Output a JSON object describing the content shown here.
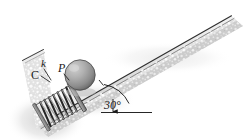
{
  "figure": {
    "name": "spring-loaded-ball-on-incline",
    "labels": {
      "spring_stiffness": "k",
      "ball": "P",
      "collar": "C",
      "incline_angle": "30°"
    }
  },
  "colors": {
    "ink": "#1a1a1a",
    "incline_fill_light": "#e8e8e8",
    "incline_fill_mid": "#c9c9c9",
    "incline_edge": "#3c3c3c",
    "ball_light": "#b6b6b6",
    "ball_dark": "#6e6e6e",
    "spring_wire": "#2b2b2b",
    "plate": "#9a9a9a",
    "shadow": "#d4d4d4",
    "background": "#ffffff"
  },
  "geometry": {
    "incline_angle_degrees": 30,
    "incline_direction": "rises left-to-right",
    "ball_center": {
      "x": 80,
      "y": 75
    },
    "ball_radius": 15,
    "spring_coils": 7,
    "wall_position": "lower-left end, perpendicular to incline"
  },
  "annotations": {
    "angle_arc": true,
    "horizontal_reference_line": true,
    "arrowhead_on_reference": true
  }
}
